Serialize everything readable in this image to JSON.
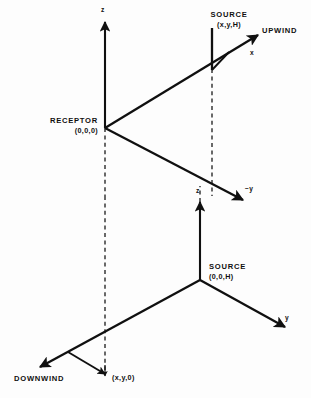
{
  "figure": {
    "background_color": "#fdfdfd",
    "ink_color": "#101010"
  },
  "upper_diagram": {
    "name": "upwind-coordinate-system",
    "axis_z_label": "z",
    "axis_x_label": "x",
    "axis_minus_y_label": "−y",
    "source_label": "SOURCE",
    "source_coords": "(x,y,H)",
    "receptor_label": "RECEPTOR",
    "receptor_coords": "(0,0,0)",
    "wind_label": "UPWIND"
  },
  "lower_diagram": {
    "name": "downwind-coordinate-system",
    "axis_z_label": "z",
    "axis_y_label": "y",
    "source_label": "SOURCE",
    "source_coords": "(0,0,H)",
    "ground_point_coords": "(x,y,0)",
    "wind_label": "DOWNWIND"
  }
}
